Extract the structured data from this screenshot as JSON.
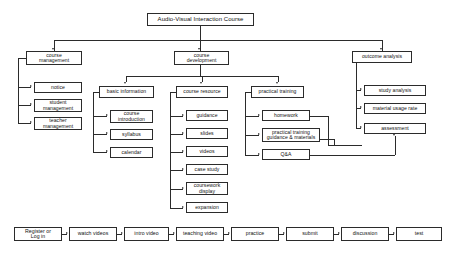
{
  "diagram": {
    "title": "Audio-Visual Interaction Course",
    "type": "hierarchy-flowchart",
    "caption": "",
    "colors": {
      "line": "#2b2b2b",
      "box_border": "#2b2b2b",
      "box_fill": "#ffffff",
      "text": "#111111",
      "background": "#ffffff"
    },
    "root": {
      "label": "Audio-Visual Interaction Course"
    },
    "branches": {
      "course_management": {
        "label": "course\nmanagement",
        "children": [
          {
            "label": "notice"
          },
          {
            "label": "student\nmanagement"
          },
          {
            "label": "teacher\nmanagement"
          }
        ]
      },
      "course_development": {
        "label": "course\ndevelopment",
        "children": [
          {
            "label": "basic information",
            "children": [
              {
                "label": "course\nintroduction"
              },
              {
                "label": "syllabus"
              },
              {
                "label": "calendar"
              }
            ]
          },
          {
            "label": "course resource",
            "children": [
              {
                "label": "guidance"
              },
              {
                "label": "slides"
              },
              {
                "label": "videos"
              },
              {
                "label": "case study"
              },
              {
                "label": "coursework\ndisplay"
              },
              {
                "label": "expansion"
              }
            ]
          },
          {
            "label": "practical training",
            "children": [
              {
                "label": "homework"
              },
              {
                "label": "practical training\nguidance & materials"
              },
              {
                "label": "Q&A"
              }
            ]
          }
        ]
      },
      "outcome_analysis": {
        "label": "outcome analysis",
        "children": [
          {
            "label": "study analysis"
          },
          {
            "label": "material usage rate"
          },
          {
            "label": "assessment"
          }
        ]
      }
    },
    "cross_links": [
      {
        "from": "homework",
        "to": "assessment"
      },
      {
        "from": "practical training guidance & materials",
        "to": "assessment"
      },
      {
        "from": "Q&A",
        "to": "assessment"
      }
    ],
    "workflow": {
      "steps": [
        {
          "label": "Register or\nLog in"
        },
        {
          "label": "watch videos"
        },
        {
          "label": "intro video"
        },
        {
          "label": "teaching video"
        },
        {
          "label": "practice"
        },
        {
          "label": "submit"
        },
        {
          "label": "discussion"
        },
        {
          "label": "test"
        }
      ]
    }
  }
}
